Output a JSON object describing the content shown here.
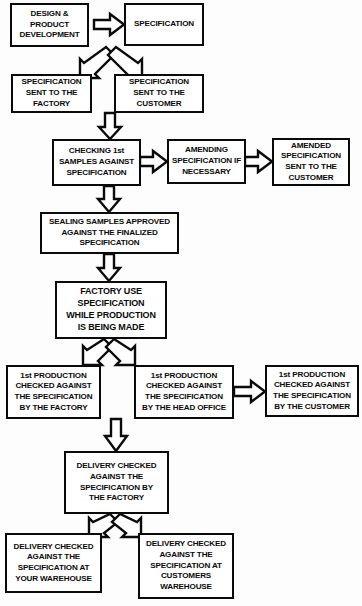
{
  "diagram": {
    "background_color": "#fdfdfd",
    "line_color": "#0a0a0a",
    "box_fill": "#ffffff",
    "nodes": [
      {
        "id": "design-product-development",
        "label": "DESIGN &\nPRODUCT\nDEVELOPMENT"
      },
      {
        "id": "specification",
        "label": "SPECIFICATION"
      },
      {
        "id": "specification-sent-factory",
        "label": "SPECIFICATION\nSENT TO THE\nFACTORY"
      },
      {
        "id": "specification-sent-customer",
        "label": "SPECIFICATION\nSENT TO THE\nCUSTOMER"
      },
      {
        "id": "checking-first-samples",
        "label": "CHECKING 1st\nSAMPLES AGAINST\nSPECIFICATION"
      },
      {
        "id": "amending-specification",
        "label": "AMENDING\nSPECIFICATION IF\nNECESSARY"
      },
      {
        "id": "amended-specification-sent-customer",
        "label": "AMENDED\nSPECIFICATION\nSENT TO THE\nCUSTOMER"
      },
      {
        "id": "sealing-samples-approved",
        "label": "SEALING SAMPLES  APPROVED\nAGAINST THE  FINALIZED\nSPECIFICATION"
      },
      {
        "id": "factory-use-specification",
        "label": "FACTORY USE\nSPECIFICATION\nWHILE PRODUCTION\nIS BEING MADE"
      },
      {
        "id": "first-production-factory",
        "label": "1st PRODUCTION\nCHECKED AGAINST\nTHE SPECIFICATION\nBY THE FACTORY"
      },
      {
        "id": "first-production-head-office",
        "label": "1st PRODUCTION\nCHECKED AGAINST\nTHE SPECIFICATION\nBY THE HEAD OFFICE"
      },
      {
        "id": "first-production-customer",
        "label": "1st PRODUCTION\nCHECKED AGAINST\nTHE SPECIFICATION\nBY THE CUSTOMER"
      },
      {
        "id": "delivery-checked-factory",
        "label": "DELIVERY CHECKED\nAGAINST THE\nSPECIFICATION BY\nTHE FACTORY"
      },
      {
        "id": "delivery-checked-your-warehouse",
        "label": "DELIVERY CHECKED\nAGAINST THE\nSPECIFICATION AT\nYOUR WAREHOUSE"
      },
      {
        "id": "delivery-checked-customers-warehouse",
        "label": "DELIVERY  CHECKED\nAGAINST THE\nSPECIFICATION AT\nCUSTOMERS\nWAREHOUSE"
      }
    ],
    "connectors": [
      {
        "id": "arrow-design-to-specification",
        "direction": "right"
      },
      {
        "id": "arrow-specification-to-factory",
        "direction": "down-left"
      },
      {
        "id": "arrow-specification-to-customer",
        "direction": "down-right"
      },
      {
        "id": "arrow-sent-to-checking",
        "direction": "down"
      },
      {
        "id": "arrow-checking-to-amending",
        "direction": "right"
      },
      {
        "id": "arrow-amending-to-amended",
        "direction": "right"
      },
      {
        "id": "arrow-checking-to-sealing",
        "direction": "down"
      },
      {
        "id": "arrow-sealing-to-factory-use",
        "direction": "down"
      },
      {
        "id": "arrow-factory-use-to-production-factory",
        "direction": "down-left"
      },
      {
        "id": "arrow-factory-use-to-production-head-office",
        "direction": "down-right"
      },
      {
        "id": "arrow-head-office-to-customer",
        "direction": "right"
      },
      {
        "id": "arrow-production-to-delivery",
        "direction": "down"
      },
      {
        "id": "arrow-delivery-to-your-warehouse",
        "direction": "down-left"
      },
      {
        "id": "arrow-delivery-to-customers-warehouse",
        "direction": "down-right"
      }
    ]
  }
}
